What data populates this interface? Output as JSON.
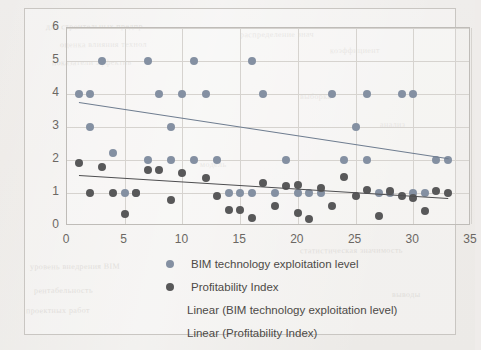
{
  "figure": {
    "background_color": "#efecea",
    "frame_color": "#c9c6c2"
  },
  "legend": {
    "items": [
      {
        "label": "BIM technology exploitation level",
        "marker": "dot",
        "color": "#8490a2",
        "name": "legend-item-bim-dot"
      },
      {
        "label": "Profitability Index",
        "marker": "dot",
        "color": "#585859",
        "name": "legend-item-profitability-dot"
      },
      {
        "label": "Linear (BIM technology exploitation level)",
        "marker": "line",
        "color": "#6f7d90",
        "name": "legend-item-bim-trendline"
      },
      {
        "label": "Linear (Profitability Index)",
        "marker": "line",
        "color": "#4e4e50",
        "name": "legend-item-profitability-trendline"
      }
    ]
  },
  "chart_data": {
    "type": "scatter",
    "title": "",
    "xlabel": "",
    "ylabel": "",
    "xlim": [
      0,
      35
    ],
    "ylim": [
      0,
      6
    ],
    "xticks": [
      0,
      5,
      10,
      15,
      20,
      25,
      30,
      35
    ],
    "yticks": [
      0,
      1,
      2,
      3,
      4,
      5,
      6
    ],
    "grid": true,
    "legend_position": "bottom",
    "series": [
      {
        "name": "BIM technology exploitation level",
        "color": "#8490a2",
        "marker": "circle",
        "points": [
          [
            1,
            4
          ],
          [
            2,
            4
          ],
          [
            2,
            3
          ],
          [
            3,
            5
          ],
          [
            4,
            2.2
          ],
          [
            5,
            1
          ],
          [
            6,
            1
          ],
          [
            7,
            2
          ],
          [
            7,
            5
          ],
          [
            8,
            4
          ],
          [
            9,
            3
          ],
          [
            9,
            2
          ],
          [
            10,
            4
          ],
          [
            11,
            2
          ],
          [
            11,
            5
          ],
          [
            12,
            4
          ],
          [
            13,
            2
          ],
          [
            14,
            1
          ],
          [
            15,
            1
          ],
          [
            16,
            1
          ],
          [
            16,
            5
          ],
          [
            17,
            4
          ],
          [
            18,
            1
          ],
          [
            19,
            2
          ],
          [
            20,
            1
          ],
          [
            21,
            1
          ],
          [
            22,
            1
          ],
          [
            23,
            4
          ],
          [
            24,
            2
          ],
          [
            25,
            3
          ],
          [
            26,
            4
          ],
          [
            26,
            2
          ],
          [
            27,
            1
          ],
          [
            28,
            1
          ],
          [
            29,
            4
          ],
          [
            30,
            1
          ],
          [
            30,
            4
          ],
          [
            31,
            1
          ],
          [
            32,
            2
          ],
          [
            33,
            2
          ]
        ]
      },
      {
        "name": "Profitability Index",
        "color": "#585859",
        "marker": "circle",
        "points": [
          [
            1,
            1.9
          ],
          [
            2,
            1
          ],
          [
            3,
            1.8
          ],
          [
            4,
            1
          ],
          [
            5,
            0.35
          ],
          [
            6,
            1
          ],
          [
            7,
            1.7
          ],
          [
            8,
            1.7
          ],
          [
            9,
            0.8
          ],
          [
            10,
            1.6
          ],
          [
            12,
            1.45
          ],
          [
            13,
            0.9
          ],
          [
            14,
            0.5
          ],
          [
            15,
            0.5
          ],
          [
            16,
            0.25
          ],
          [
            17,
            1.3
          ],
          [
            18,
            0.6
          ],
          [
            19,
            1.2
          ],
          [
            20,
            1.25
          ],
          [
            20,
            0.4
          ],
          [
            21,
            0.2
          ],
          [
            22,
            1.15
          ],
          [
            23,
            0.6
          ],
          [
            24,
            1.5
          ],
          [
            25,
            0.9
          ],
          [
            26,
            1.1
          ],
          [
            27,
            0.3
          ],
          [
            28,
            1.05
          ],
          [
            29,
            0.9
          ],
          [
            30,
            0.85
          ],
          [
            31,
            0.45
          ],
          [
            32,
            1.05
          ],
          [
            33,
            1
          ]
        ]
      }
    ],
    "trendlines": [
      {
        "name": "Linear (BIM technology exploitation level)",
        "color": "#6f7d90",
        "x0": 1,
        "y0": 3.75,
        "x1": 33,
        "y1": 2.05
      },
      {
        "name": "Linear (Profitability Index)",
        "color": "#4e4e50",
        "x0": 1,
        "y0": 1.55,
        "x1": 33,
        "y1": 0.85
      }
    ]
  },
  "bleed_text": [
    {
      "text": "для строительных предпр",
      "x": 46,
      "y": 22
    },
    {
      "text": "оценка влияния технол",
      "x": 60,
      "y": 40
    },
    {
      "text": "показатели эффектив",
      "x": 52,
      "y": 58
    },
    {
      "text": "распределение знач",
      "x": 240,
      "y": 30
    },
    {
      "text": "коэффициент",
      "x": 330,
      "y": 46
    },
    {
      "text": "выборка",
      "x": 300,
      "y": 92
    },
    {
      "text": "анализ",
      "x": 380,
      "y": 120
    },
    {
      "text": "модель",
      "x": 200,
      "y": 160
    },
    {
      "text": "уровень внедрения BIM",
      "x": 30,
      "y": 262
    },
    {
      "text": "рентабельность",
      "x": 34,
      "y": 286
    },
    {
      "text": "проектных работ",
      "x": 26,
      "y": 306
    },
    {
      "text": "статистическая значимость",
      "x": 300,
      "y": 246
    },
    {
      "text": "выводы",
      "x": 392,
      "y": 290
    }
  ]
}
